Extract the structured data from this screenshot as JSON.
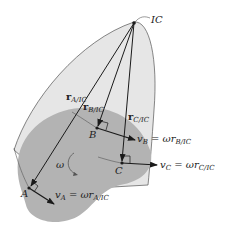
{
  "diagram": {
    "colors": {
      "light_region": "#e6e6e6",
      "dark_region": "#b3b3b3",
      "line": "#1a1a1a"
    },
    "labels": {
      "ic": "IC",
      "point_a": "A",
      "point_b": "B",
      "point_c": "C",
      "omega": "ω",
      "r_a": {
        "main": "r",
        "sub": "A/IC"
      },
      "r_b": {
        "main": "r",
        "sub": "B/IC"
      },
      "r_c": {
        "main": "r",
        "sub": "C/IC"
      },
      "v_a": {
        "v": "v",
        "vsub": "A",
        "eq": " = ωr",
        "rsub": "A/IC"
      },
      "v_b": {
        "v": "v",
        "vsub": "B",
        "eq": " = ωr",
        "rsub": "B/IC"
      },
      "v_c": {
        "v": "v",
        "vsub": "C",
        "eq": " = ωr",
        "rsub": "C/IC"
      }
    }
  }
}
